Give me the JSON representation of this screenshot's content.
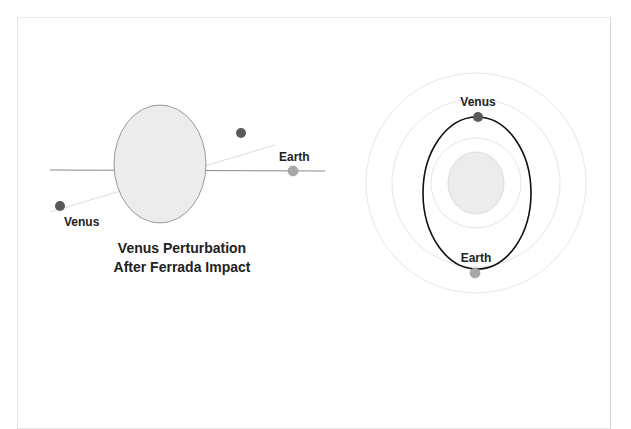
{
  "left_diagram": {
    "title_line1": "Venus Perturbation",
    "title_line2": "After Ferrada Impact",
    "venus_label": "Venus",
    "earth_label": "Earth"
  },
  "right_diagram": {
    "venus_label": "Venus",
    "earth_label": "Earth"
  },
  "colors": {
    "venus": "#5a5a5a",
    "earth": "#a8a8a8",
    "impactor_fill": "#ececec",
    "orbit_faint": "#e6e6e6",
    "orbit_bold": "#111111"
  }
}
